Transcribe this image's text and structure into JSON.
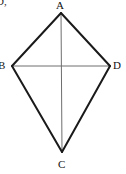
{
  "figure": {
    "type": "geometry-diagram",
    "shape_name": "kite",
    "background_color": "#ffffff",
    "outline_color": "#1a1a1a",
    "diagonal_color": "#6e6e6e",
    "outline_width": 2,
    "diagonal_width": 1,
    "corner_artifact": "D,",
    "vertices": [
      {
        "id": "A",
        "label": "A",
        "x": 61,
        "y": 13,
        "position": "top"
      },
      {
        "id": "B",
        "label": "B",
        "x": 12,
        "y": 66,
        "position": "left"
      },
      {
        "id": "C",
        "label": "C",
        "x": 62,
        "y": 152,
        "position": "bottom"
      },
      {
        "id": "D",
        "label": "D",
        "x": 110,
        "y": 66,
        "position": "right"
      }
    ],
    "edges": [
      {
        "id": "AB",
        "from": "A",
        "to": "B",
        "style": "solid-thick"
      },
      {
        "id": "AD",
        "from": "A",
        "to": "D",
        "style": "solid-thick"
      },
      {
        "id": "BC",
        "from": "B",
        "to": "C",
        "style": "solid-thick"
      },
      {
        "id": "DC",
        "from": "D",
        "to": "C",
        "style": "solid-thick"
      }
    ],
    "diagonals": [
      {
        "id": "AC",
        "from": "A",
        "to": "C",
        "style": "solid-thin",
        "orientation": "vertical"
      },
      {
        "id": "BD",
        "from": "B",
        "to": "D",
        "style": "solid-thin",
        "orientation": "horizontal"
      }
    ],
    "polygon_points": "61,13 110,66 62,152 12,66"
  }
}
